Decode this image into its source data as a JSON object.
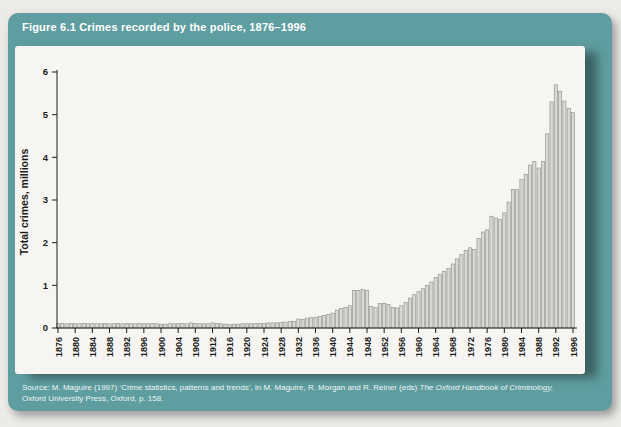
{
  "figure": {
    "title": "Figure 6.1 Crimes recorded by the police, 1876–1996",
    "source_line1_regular": "Source: M. Maguire (1997) ‘Crime statistics, patterns and trends’, in M. Maguire, R. Morgan and R. Reiner (eds) ",
    "source_line1_italic": "The Oxford Handbook of Criminology,",
    "source_line2": "Oxford University Press, Oxford, p. 158."
  },
  "colors": {
    "card_teal": "#5f9ea0",
    "panel_bg": "#f6f5f1",
    "bar_fill": "#d9d8d4",
    "bar_stroke": "#8a8a87",
    "axis": "#1c1c1c",
    "title_text": "#ffffff"
  },
  "chart_data": {
    "type": "bar",
    "title": "Crimes recorded by the police, 1876–1996",
    "xlabel": "",
    "ylabel": "Total crimes, millions",
    "ylim": [
      0,
      6
    ],
    "yticks": [
      0,
      1,
      2,
      3,
      4,
      5,
      6
    ],
    "grid": false,
    "legend": "none",
    "x_start_year": 1876,
    "x_end_year": 1996,
    "xtick_years": [
      1876,
      1880,
      1884,
      1888,
      1892,
      1896,
      1900,
      1904,
      1908,
      1912,
      1916,
      1920,
      1924,
      1928,
      1932,
      1936,
      1940,
      1944,
      1948,
      1952,
      1956,
      1960,
      1964,
      1968,
      1972,
      1976,
      1980,
      1984,
      1988,
      1992,
      1996
    ],
    "years": [
      1876,
      1877,
      1878,
      1879,
      1880,
      1881,
      1882,
      1883,
      1884,
      1885,
      1886,
      1887,
      1888,
      1889,
      1890,
      1891,
      1892,
      1893,
      1894,
      1895,
      1896,
      1897,
      1898,
      1899,
      1900,
      1901,
      1902,
      1903,
      1904,
      1905,
      1906,
      1907,
      1908,
      1909,
      1910,
      1911,
      1912,
      1913,
      1914,
      1915,
      1916,
      1917,
      1918,
      1919,
      1920,
      1921,
      1922,
      1923,
      1924,
      1925,
      1926,
      1927,
      1928,
      1929,
      1930,
      1931,
      1932,
      1933,
      1934,
      1935,
      1936,
      1937,
      1938,
      1939,
      1940,
      1941,
      1942,
      1943,
      1944,
      1945,
      1946,
      1947,
      1948,
      1949,
      1950,
      1951,
      1952,
      1953,
      1954,
      1955,
      1956,
      1957,
      1958,
      1959,
      1960,
      1961,
      1962,
      1963,
      1964,
      1965,
      1966,
      1967,
      1968,
      1969,
      1970,
      1971,
      1972,
      1973,
      1974,
      1975,
      1976,
      1977,
      1978,
      1979,
      1980,
      1981,
      1982,
      1983,
      1984,
      1985,
      1986,
      1987,
      1988,
      1989,
      1990,
      1991,
      1992,
      1993,
      1994,
      1995,
      1996
    ],
    "values": [
      0.1,
      0.11,
      0.1,
      0.11,
      0.1,
      0.1,
      0.11,
      0.1,
      0.11,
      0.1,
      0.1,
      0.11,
      0.1,
      0.1,
      0.11,
      0.1,
      0.11,
      0.1,
      0.1,
      0.11,
      0.1,
      0.1,
      0.11,
      0.1,
      0.09,
      0.09,
      0.1,
      0.1,
      0.1,
      0.11,
      0.1,
      0.12,
      0.11,
      0.1,
      0.1,
      0.1,
      0.12,
      0.11,
      0.1,
      0.09,
      0.08,
      0.09,
      0.09,
      0.1,
      0.1,
      0.1,
      0.11,
      0.11,
      0.11,
      0.12,
      0.12,
      0.12,
      0.13,
      0.14,
      0.15,
      0.16,
      0.21,
      0.2,
      0.23,
      0.24,
      0.25,
      0.27,
      0.3,
      0.32,
      0.35,
      0.42,
      0.46,
      0.48,
      0.52,
      0.88,
      0.88,
      0.9,
      0.88,
      0.5,
      0.48,
      0.57,
      0.58,
      0.55,
      0.48,
      0.47,
      0.52,
      0.6,
      0.7,
      0.78,
      0.85,
      0.92,
      1.0,
      1.08,
      1.18,
      1.26,
      1.33,
      1.4,
      1.5,
      1.62,
      1.72,
      1.82,
      1.88,
      1.84,
      2.1,
      2.25,
      2.3,
      2.62,
      2.58,
      2.54,
      2.7,
      2.95,
      3.25,
      3.24,
      3.48,
      3.6,
      3.82,
      3.9,
      3.75,
      3.9,
      4.55,
      5.3,
      5.7,
      5.55,
      5.32,
      5.15,
      5.05
    ]
  }
}
